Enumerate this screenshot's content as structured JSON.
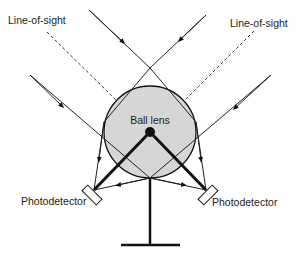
{
  "diagram": {
    "labels": {
      "line_of_sight_left": "Line-of-sight",
      "line_of_sight_right": "Line-of-sight",
      "ball_lens": "Ball lens",
      "photodetector_left": "Photodetector",
      "photodetector_right": "Photodetector"
    },
    "colors": {
      "ball_fill": "#d6d6d6",
      "stroke": "#111111",
      "background": "#ffffff"
    }
  }
}
